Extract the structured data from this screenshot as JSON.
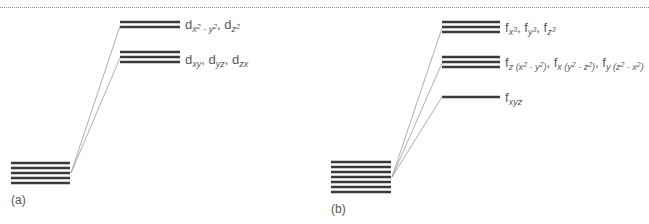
{
  "figure": {
    "separator": "dotted-rule",
    "panels": [
      {
        "id": "a",
        "label": "(a)",
        "degenerate_level_count": 5,
        "split_levels": [
          {
            "name": "upper",
            "count": 2,
            "orbitals": [
              "d_{x2-y2}",
              "d_{z2}"
            ]
          },
          {
            "name": "lower",
            "count": 3,
            "orbitals": [
              "d_{xy}",
              "d_{yz}",
              "d_{zx}"
            ]
          }
        ]
      },
      {
        "id": "b",
        "label": "(b)",
        "degenerate_level_count": 7,
        "split_levels": [
          {
            "name": "upper",
            "count": 3,
            "orbitals": [
              "f_{x3}",
              "f_{y3}",
              "f_{z3}"
            ]
          },
          {
            "name": "middle",
            "count": 3,
            "orbitals": [
              "f_{z(x2-y2)}",
              "f_{x(y2-z2)}",
              "f_{y(z2-x2)}"
            ]
          },
          {
            "name": "lower",
            "count": 1,
            "orbitals": [
              "f_{xyz}"
            ]
          }
        ]
      }
    ]
  },
  "labels": {
    "a_upper": {
      "base": "d",
      "sub1": "x",
      "sup1": "2",
      "mid": " - ",
      "sub2": "y",
      "sup2": "2",
      "sep": ", ",
      "base2": "d",
      "sub3": "z",
      "sup3": "2"
    },
    "a_lower": {
      "t1": "d",
      "s1": "xy",
      "t2": ", d",
      "s2": "yz",
      "t3": ", d",
      "s3": "zx"
    },
    "b_upper": {
      "t1": "f",
      "s1": "x",
      "p1": "3",
      "t2": ", f",
      "s2": "y",
      "p2": "3",
      "t3": ", f",
      "s3": "z",
      "p3": "3"
    },
    "b_middle": {
      "t1": "f",
      "s1a": "z (x",
      "p1a": "2",
      "s1b": " - y",
      "p1b": "2",
      "s1c": ")",
      "t2": ", f",
      "s2a": "x (y",
      "p2a": "2",
      "s2b": " - z",
      "p2b": "2",
      "s2c": ")",
      "t3": ", f",
      "s3a": "y (z",
      "p3a": "2",
      "s3b": " - x",
      "p3b": "2",
      "s3c": ")"
    },
    "b_lower": {
      "t1": "f",
      "s1": "xyz"
    },
    "panel_a": "(a)",
    "panel_b": "(b)"
  },
  "colors": {
    "level_line": "#3a3a3a",
    "connector": "#9a9a9a",
    "text": "#5a5a5a"
  }
}
